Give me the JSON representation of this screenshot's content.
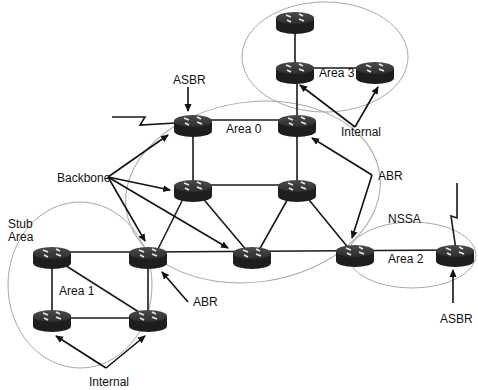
{
  "diagram": {
    "type": "OSPF area topology",
    "areas": [
      {
        "id": "area0",
        "label": "Area 0",
        "role": "backbone"
      },
      {
        "id": "area1",
        "label": "Area 1",
        "qualifier": "Stub Area"
      },
      {
        "id": "area2",
        "label": "Area 2",
        "qualifier": "NSSA"
      },
      {
        "id": "area3",
        "label": "Area 3"
      }
    ],
    "labels": {
      "asbr_top": "ASBR",
      "area0": "Area 0",
      "area1": "Area 1",
      "area2": "Area 2",
      "area3": "Area 3",
      "internal_top": "Internal",
      "internal_bottom": "Internal",
      "backbone": "Backbone",
      "abr_right": "ABR",
      "abr_left": "ABR",
      "stub_line1": "Stub",
      "stub_line2": "Area",
      "nssa": "NSSA",
      "asbr_bottom": "ASBR"
    },
    "routers": [
      {
        "id": "r3-top",
        "area": "Area 3",
        "role": "Internal"
      },
      {
        "id": "r3-mid",
        "area": "Area 3",
        "role": "Internal"
      },
      {
        "id": "r3-right",
        "area": "Area 3",
        "role": "Internal"
      },
      {
        "id": "r0-asbr",
        "area": "Area 0",
        "role": "ASBR / Backbone"
      },
      {
        "id": "r0-abr-top",
        "area": "Area 0 / Area 3",
        "role": "ABR"
      },
      {
        "id": "r0-mid-left",
        "area": "Area 0",
        "role": "Backbone"
      },
      {
        "id": "r0-mid-right",
        "area": "Area 0",
        "role": "Backbone"
      },
      {
        "id": "r0-center",
        "area": "Area 0",
        "role": "Backbone"
      },
      {
        "id": "r2-abr",
        "area": "Area 0 / Area 2",
        "role": "ABR / Backbone"
      },
      {
        "id": "r2-asbr",
        "area": "Area 2",
        "role": "ASBR"
      },
      {
        "id": "r1-abr",
        "area": "Area 0 / Area 1",
        "role": "ABR / Backbone"
      },
      {
        "id": "r1-top-left",
        "area": "Area 1",
        "role": "Internal"
      },
      {
        "id": "r1-bottom-left",
        "area": "Area 1",
        "role": "Internal"
      },
      {
        "id": "r1-bottom-right",
        "area": "Area 1",
        "role": "Internal"
      }
    ],
    "links": [
      [
        "r3-top",
        "r3-mid"
      ],
      [
        "r3-mid",
        "r3-right"
      ],
      [
        "r3-mid",
        "r0-abr-top"
      ],
      [
        "r0-asbr",
        "r0-abr-top"
      ],
      [
        "r0-asbr",
        "r0-mid-left"
      ],
      [
        "r0-abr-top",
        "r0-mid-right"
      ],
      [
        "r0-mid-left",
        "r0-mid-right"
      ],
      [
        "r0-mid-left",
        "r1-abr"
      ],
      [
        "r0-mid-left",
        "r0-center"
      ],
      [
        "r0-mid-right",
        "r0-center"
      ],
      [
        "r0-mid-right",
        "r2-abr"
      ],
      [
        "r1-abr",
        "r0-center"
      ],
      [
        "r0-center",
        "r2-abr"
      ],
      [
        "r2-abr",
        "r2-asbr"
      ],
      [
        "r1-top-left",
        "r1-abr"
      ],
      [
        "r1-top-left",
        "r1-bottom-left"
      ],
      [
        "r1-top-left",
        "r1-bottom-right"
      ],
      [
        "r1-bottom-left",
        "r1-bottom-right"
      ],
      [
        "r1-abr",
        "r1-bottom-right"
      ]
    ],
    "external_links": [
      "r0-asbr (serial, left)",
      "r2-asbr (serial, top)"
    ]
  }
}
